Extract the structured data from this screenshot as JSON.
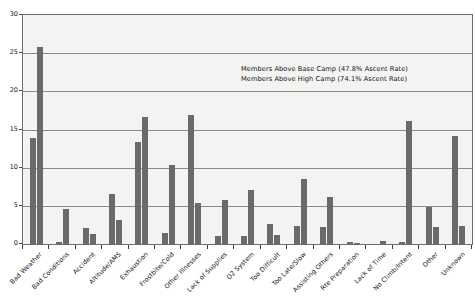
{
  "chart_data": {
    "type": "bar",
    "title": "",
    "xlabel": "",
    "ylabel": "",
    "ylim": [
      0,
      30
    ],
    "ytick_labels": [
      "0",
      "5",
      "10",
      "15",
      "20",
      "25",
      "30"
    ],
    "ytick_values": [
      0,
      5,
      10,
      15,
      20,
      25,
      30
    ],
    "grid": true,
    "legend_position": "inside-upper-right",
    "categories": [
      "Bad Weather",
      "Bad Conditions",
      "Accident",
      "Altitude/AMS",
      "Exhaustion",
      "Frostbite/Cold",
      "Other Illnesses",
      "Lack of Supplies",
      "O2 System",
      "Too Difficult",
      "Too Late/Slow",
      "Assisting Others",
      "Rte Preparation",
      "Lack of Time",
      "No Climb/Intent",
      "Other",
      "Unknown"
    ],
    "series": [
      {
        "name": "Members Above Base Camp (47.8% Ascent Rate)",
        "values": [
          13.9,
          0.2,
          2.1,
          6.6,
          13.3,
          1.4,
          16.9,
          1.1,
          1.0,
          2.6,
          2.4,
          2.2,
          0.2,
          0.0,
          0.3,
          4.8,
          14.2
        ]
      },
      {
        "name": "Members Above High Camp (74.1% Ascent Rate)",
        "values": [
          25.8,
          4.6,
          1.3,
          3.1,
          16.6,
          10.4,
          5.4,
          5.8,
          7.1,
          1.2,
          8.5,
          6.1,
          0.1,
          0.4,
          16.1,
          2.2,
          2.3
        ]
      }
    ],
    "annotations": [
      "Members Above Base Camp (47.8% Ascent Rate)",
      "Members Above High Camp (74.1% Ascent Rate)"
    ],
    "colors": {
      "bar": "#6a6a6a",
      "plot_background": "#f3f3f1",
      "gridline": "#8a8a8a",
      "frame": "#6d6d6d",
      "text": "#141414"
    }
  }
}
